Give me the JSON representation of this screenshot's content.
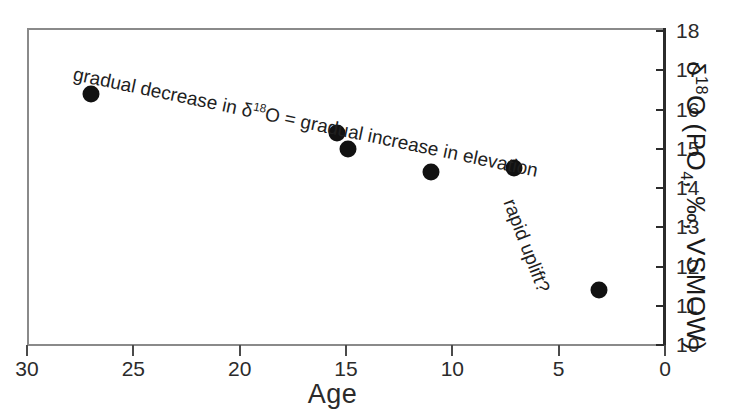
{
  "chart_data": {
    "type": "scatter",
    "title": "",
    "xlabel": "Age",
    "ylabel": "δ18O (PO4, ‰, VSMOW)",
    "ylabel_parts": {
      "delta": "δ",
      "iso_sup": "18",
      "o": "O",
      "open": " (PO",
      "po_sub": "4",
      "tail": ", ‰, VSMOW)"
    },
    "xlim": [
      30,
      0
    ],
    "ylim": [
      10,
      18
    ],
    "x_reversed": true,
    "grid": false,
    "legend": "none",
    "xticks": [
      30,
      25,
      20,
      15,
      10,
      5,
      0
    ],
    "yticks": [
      18,
      17,
      16,
      15,
      14,
      13,
      12,
      11,
      10
    ],
    "x": [
      27.0,
      15.4,
      14.9,
      11.0,
      7.1,
      3.1
    ],
    "y": [
      16.4,
      15.4,
      15.0,
      14.4,
      14.5,
      11.4
    ],
    "points": [
      {
        "x": 27.0,
        "y": 16.4
      },
      {
        "x": 15.4,
        "y": 15.4
      },
      {
        "x": 14.9,
        "y": 15.0
      },
      {
        "x": 11.0,
        "y": 14.4
      },
      {
        "x": 7.1,
        "y": 14.5
      },
      {
        "x": 3.1,
        "y": 11.4
      }
    ],
    "marker": {
      "shape": "circle",
      "color": "#111111",
      "size": 17
    },
    "annotations": [
      {
        "name": "gradual-decrease",
        "text_plain": "gradual decrease in δ18O = gradual increase in elevation",
        "parts": {
          "before": "gradual decrease in ",
          "delta": "δ",
          "iso_sup": "18",
          "o": "O",
          "after": " = gradual increase in elevation"
        },
        "rotation_deg": 11.8
      },
      {
        "name": "rapid-uplift",
        "text_plain": "rapid uplift?",
        "rotation_deg": 69
      }
    ]
  },
  "style": {
    "background": "#ffffff",
    "frame_color": "#8a8a8a",
    "axis_color": "#2b2b2b",
    "text_color": "#1a1a1a",
    "marker_color": "#111111"
  }
}
